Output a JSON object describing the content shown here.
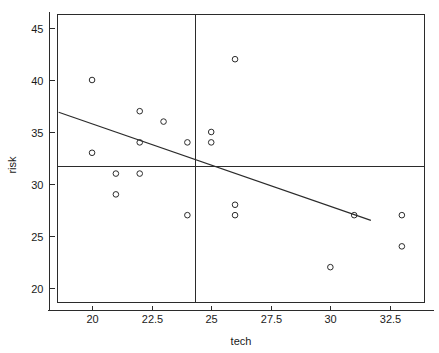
{
  "chart_data": {
    "type": "scatter",
    "title": "",
    "xlabel": "tech",
    "ylabel": "risk",
    "xlim": [
      18.55,
      33.95
    ],
    "ylim": [
      18.6,
      46.3
    ],
    "grid": false,
    "legend": "none",
    "x_ticks": [
      20,
      22.5,
      25,
      27.5,
      30,
      32.5
    ],
    "x_tick_labels": [
      "20",
      "22.5",
      "25",
      "27.5",
      "30",
      "32.5"
    ],
    "y_ticks": [
      20,
      25,
      30,
      35,
      40,
      45
    ],
    "y_tick_labels": [
      "20",
      "25",
      "30",
      "35",
      "40",
      "45"
    ],
    "points": [
      {
        "x": 20,
        "y": 40
      },
      {
        "x": 20,
        "y": 33
      },
      {
        "x": 21,
        "y": 31
      },
      {
        "x": 21,
        "y": 29
      },
      {
        "x": 22,
        "y": 37
      },
      {
        "x": 22,
        "y": 34
      },
      {
        "x": 22,
        "y": 31
      },
      {
        "x": 23,
        "y": 36
      },
      {
        "x": 24,
        "y": 34
      },
      {
        "x": 24,
        "y": 27
      },
      {
        "x": 25,
        "y": 35
      },
      {
        "x": 25,
        "y": 34
      },
      {
        "x": 26,
        "y": 42
      },
      {
        "x": 26,
        "y": 28
      },
      {
        "x": 26,
        "y": 27
      },
      {
        "x": 30,
        "y": 22
      },
      {
        "x": 31,
        "y": 27
      },
      {
        "x": 33,
        "y": 27
      },
      {
        "x": 33,
        "y": 24
      }
    ],
    "marker": "open-circle",
    "marker_size": 4,
    "regression_line": {
      "x_start": 18.6,
      "y_start": 36.9,
      "x_end": 31.7,
      "y_end": 26.5,
      "slope": -0.794,
      "intercept": 51.67
    },
    "reference_lines": [
      {
        "orientation": "vertical",
        "value": 24.3,
        "label": "mean-tech"
      },
      {
        "orientation": "horizontal",
        "value": 31.7,
        "label": "mean-risk"
      }
    ],
    "colors": {
      "axis": "#2b2b2b",
      "marker": "#2b2b2b",
      "line": "#2b2b2b",
      "background": "#ffffff"
    }
  }
}
